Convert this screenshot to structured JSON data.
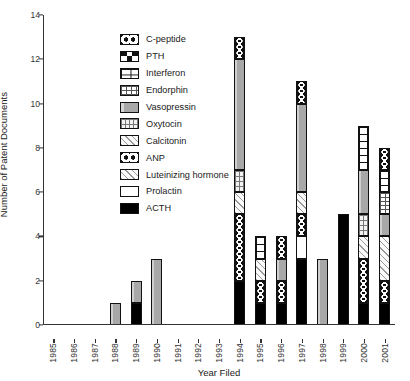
{
  "chart_data": {
    "type": "bar",
    "subtype": "stacked-bar",
    "title": "",
    "xlabel": "Year Filed",
    "ylabel": "Number of Patent Documents",
    "ylim": [
      0,
      14
    ],
    "ytick_step": 2,
    "yticks": [
      "0",
      "2",
      "4",
      "6",
      "8",
      "10",
      "12",
      "14"
    ],
    "grid": false,
    "legend_position": "upper-left-inside",
    "categories": [
      "1985",
      "1986",
      "1987",
      "1988",
      "1989",
      "1990",
      "1991",
      "1992",
      "1993",
      "1994",
      "1995",
      "1996",
      "1997",
      "1998",
      "1999",
      "2000",
      "2001"
    ],
    "series": [
      {
        "name": "C-peptide",
        "pattern": "cpeptide",
        "values": [
          0,
          0,
          0,
          0,
          0,
          0,
          0,
          0,
          0,
          1,
          0,
          1,
          1,
          0,
          0,
          0,
          1
        ]
      },
      {
        "name": "PTH",
        "pattern": "pth",
        "values": [
          0,
          0,
          0,
          0,
          0,
          0,
          0,
          0,
          0,
          0,
          0,
          0,
          0,
          0,
          0,
          0,
          0
        ]
      },
      {
        "name": "Interferon",
        "pattern": "interferon",
        "values": [
          0,
          0,
          0,
          0,
          0,
          0,
          0,
          0,
          0,
          0,
          1,
          0,
          0,
          0,
          0,
          2,
          1
        ]
      },
      {
        "name": "Endorphin",
        "pattern": "endorphin",
        "values": [
          0,
          0,
          0,
          0,
          0,
          0,
          0,
          0,
          0,
          0,
          0,
          0,
          0,
          0,
          0,
          0,
          1
        ]
      },
      {
        "name": "Vasopressin",
        "pattern": "vasopressin",
        "values": [
          0,
          0,
          0,
          1,
          1,
          3,
          0,
          0,
          0,
          5,
          0,
          1,
          4,
          3,
          0,
          2,
          1
        ]
      },
      {
        "name": "Oxytocin",
        "pattern": "oxytocin",
        "values": [
          0,
          0,
          0,
          0,
          0,
          0,
          0,
          0,
          0,
          1,
          0,
          0,
          0,
          0,
          0,
          1,
          0
        ]
      },
      {
        "name": "Calcitonin",
        "pattern": "calcitonin",
        "values": [
          0,
          0,
          0,
          0,
          0,
          0,
          0,
          0,
          0,
          1,
          1,
          0,
          1,
          0,
          0,
          1,
          2
        ]
      },
      {
        "name": "ANP",
        "pattern": "anp",
        "values": [
          0,
          0,
          0,
          0,
          0,
          0,
          0,
          0,
          0,
          3,
          1,
          1,
          1,
          0,
          0,
          2,
          1
        ]
      },
      {
        "name": "Luteinizing hormone",
        "pattern": "lh",
        "values": [
          0,
          0,
          0,
          0,
          0,
          0,
          0,
          0,
          0,
          0,
          0,
          0,
          0,
          0,
          0,
          0,
          0
        ]
      },
      {
        "name": "Prolactin",
        "pattern": "prolactin",
        "values": [
          0,
          0,
          0,
          0,
          0,
          0,
          0,
          0,
          0,
          0,
          0,
          0,
          1,
          0,
          0,
          0,
          0
        ]
      },
      {
        "name": "ACTH",
        "pattern": "acth",
        "values": [
          0,
          0,
          0,
          0,
          1,
          0,
          0,
          0,
          0,
          2,
          1,
          1,
          3,
          0,
          5,
          1,
          1
        ]
      }
    ],
    "totals": [
      0,
      0,
      0,
      1,
      2,
      3,
      0,
      0,
      0,
      13,
      4,
      4,
      11,
      3,
      5,
      9,
      8
    ]
  },
  "legend": {
    "items": [
      {
        "label": "C-peptide",
        "pattern": "cpeptide"
      },
      {
        "label": "PTH",
        "pattern": "pth"
      },
      {
        "label": "Interferon",
        "pattern": "interferon"
      },
      {
        "label": "Endorphin",
        "pattern": "endorphin"
      },
      {
        "label": "Vasopressin",
        "pattern": "vasopressin"
      },
      {
        "label": "Oxytocin",
        "pattern": "oxytocin"
      },
      {
        "label": "Calcitonin",
        "pattern": "calcitonin"
      },
      {
        "label": "ANP",
        "pattern": "anp"
      },
      {
        "label": "Luteinizing hormone",
        "pattern": "lh"
      },
      {
        "label": "Prolactin",
        "pattern": "prolactin"
      },
      {
        "label": "ACTH",
        "pattern": "acth"
      }
    ]
  },
  "colors": {
    "axis": "#333333",
    "outline": "#111111",
    "fill_dark": "#000000",
    "fill_gray": "#a8a8a8",
    "fill_light": "#fafafa",
    "background": "#ffffff"
  }
}
